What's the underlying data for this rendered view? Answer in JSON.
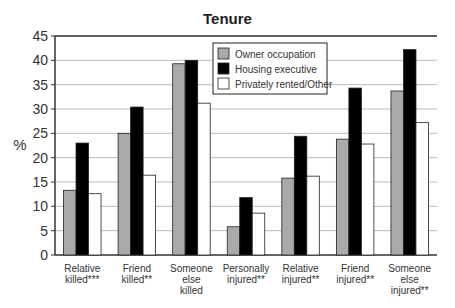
{
  "chart_data": {
    "type": "bar",
    "title": "Tenure",
    "xlabel": "",
    "ylabel": "%",
    "ylim": [
      0,
      45
    ],
    "yticks": [
      0,
      5,
      10,
      15,
      20,
      25,
      30,
      35,
      40,
      45
    ],
    "grid": true,
    "legend_position": "top-center inside plot",
    "categories": [
      [
        "Relative",
        "killed***"
      ],
      [
        "Friend",
        "killed**"
      ],
      [
        "Someone",
        "else",
        "killed"
      ],
      [
        "Personally",
        "injured**"
      ],
      [
        "Relative",
        "injured**"
      ],
      [
        "Friend",
        "injured**"
      ],
      [
        "Someone",
        "else",
        "injured**"
      ]
    ],
    "series": [
      {
        "name": "Owner occupation",
        "color": "#aaaaaa",
        "values": [
          13.3,
          25,
          39.3,
          5.8,
          15.8,
          23.8,
          33.7
        ]
      },
      {
        "name": "Housing executive",
        "color": "#000000",
        "values": [
          23,
          30.4,
          40,
          11.8,
          24.4,
          34.3,
          42.2
        ]
      },
      {
        "name": "Privately rented/Other",
        "color": "#ffffff",
        "values": [
          12.6,
          16.4,
          31.2,
          8.6,
          16.2,
          22.8,
          27.2
        ]
      }
    ]
  }
}
